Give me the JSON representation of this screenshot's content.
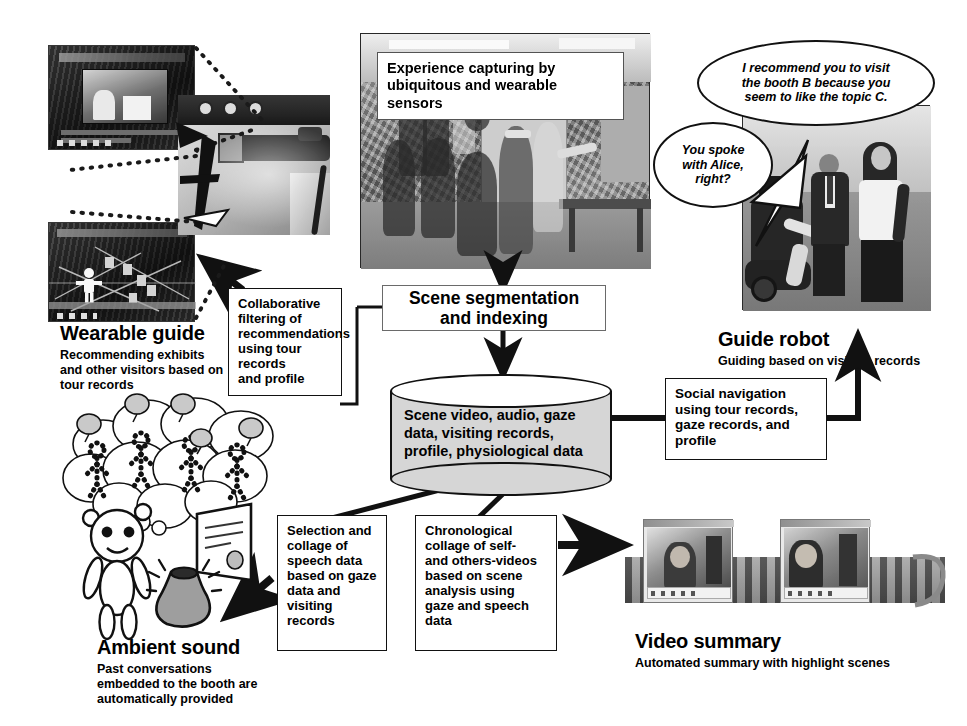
{
  "diagram": {
    "colors": {
      "line": "#111111",
      "cylinder_fill": "#d6d6d6",
      "box_fill": "#ffffff",
      "background": "#ffffff"
    }
  },
  "overlays": {
    "experience_capture": "Experience capturing by\nubiquitous and wearable sensors",
    "experience_capture_line1": "Experience capturing by",
    "experience_capture_line2": "ubiquitous and wearable sensors"
  },
  "balloons": {
    "robot_recommend": "I recommend you to visit the booth B because you seem to like the topic C.",
    "robot_recommend_l1": "I recommend you to visit",
    "robot_recommend_l2": "the booth B because you",
    "robot_recommend_l3": "seem to like the topic C.",
    "robot_ask": "You spoke with Alice, right?",
    "robot_ask_l1": "You spoke",
    "robot_ask_l2": "with Alice,",
    "robot_ask_l3": "right?"
  },
  "process": {
    "scene_segmentation_l1": "Scene segmentation",
    "scene_segmentation_l2": "and indexing",
    "scene_segmentation": "Scene segmentation and indexing"
  },
  "database": {
    "text": "Scene video, audio, gaze data, visiting records, profile, physiological data",
    "line1": "Scene video, audio, gaze",
    "line2": "data, visiting records,",
    "line3": "profile, physiological data"
  },
  "boxes": {
    "collaborative_filtering": {
      "text": "Collaborative filtering of recommendations using tour records and profile",
      "lines": [
        "Collaborative",
        "filtering of",
        "recommendations",
        "using tour records",
        "and profile"
      ]
    },
    "social_navigation": {
      "text": "Social navigation using tour records, gaze records, and profile",
      "lines": [
        "Social navigation",
        "using tour records,",
        "gaze records, and",
        "profile"
      ]
    },
    "speech_collage": {
      "text": "Selection and collage of speech data based on gaze data and visiting records",
      "lines": [
        "Selection and",
        "collage of",
        "speech data",
        "based on gaze",
        "data and",
        "visiting",
        "records"
      ]
    },
    "video_collage": {
      "text": "Chronological collage of self- and others-videos based on scene analysis using gaze and speech data",
      "lines": [
        "Chronological",
        "collage of self-",
        "and others-videos",
        "based on scene",
        "analysis using",
        "gaze and speech",
        "data"
      ]
    }
  },
  "captions": {
    "wearable_guide": {
      "title": "Wearable guide",
      "subtitle": "Recommending exhibits and other visitors based on tour records",
      "sub_lines": [
        "Recommending exhibits",
        "and other visitors based on",
        "tour records"
      ]
    },
    "guide_robot": {
      "title": "Guide robot",
      "subtitle": "Guiding based on  visiting records",
      "sub_lines": [
        "Guiding based on  visiting records"
      ]
    },
    "ambient_sound": {
      "title": "Ambient sound",
      "subtitle": "Past conversations embedded to the booth are automatically provided",
      "sub_lines": [
        "Past conversations",
        "embedded to the booth are",
        "automatically provided"
      ]
    },
    "video_summary": {
      "title": "Video summary",
      "subtitle": "Automated summary with highlight scenes",
      "sub_lines": [
        "Automated summary with highlight scenes"
      ]
    }
  },
  "photos": {
    "hmd_screen_top": "wearable-display-screenshot-video",
    "hmd_screen_bottom": "wearable-display-screenshot-map",
    "hmd_device": "head-mounted-display-photo",
    "exhibition_scene": "exhibition-hall-visitors-photo",
    "robot_scene": "guide-robot-with-visitors-photo",
    "video_strip_left": "video-player-window-woman",
    "video_strip_right": "video-player-window-man"
  }
}
